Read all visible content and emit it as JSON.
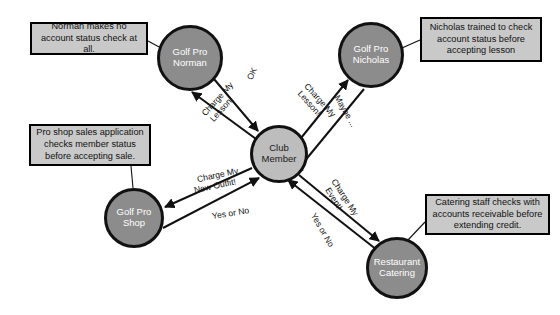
{
  "diagram": {
    "background_color": "#ffffff",
    "node_fill_dark": "#8c8c8c",
    "node_fill_light": "#bdbdbd",
    "node_stroke": "#111111",
    "note_fill": "#c9c9c9",
    "note_stroke": "#000000",
    "edge_color": "#111111"
  },
  "nodes": [
    {
      "id": "norman",
      "line1": "Golf Pro",
      "line2": "Norman",
      "style": "dark",
      "cx": 190,
      "cy": 58,
      "r": 33
    },
    {
      "id": "nicholas",
      "line1": "Golf Pro",
      "line2": "Nicholas",
      "style": "dark",
      "cx": 371,
      "cy": 55,
      "r": 33
    },
    {
      "id": "club",
      "line1": "Club",
      "line2": "Member",
      "style": "light",
      "cx": 279,
      "cy": 154,
      "r": 29
    },
    {
      "id": "shop",
      "line1": "Golf Pro",
      "line2": "Shop",
      "style": "dark",
      "cx": 134,
      "cy": 218,
      "r": 30
    },
    {
      "id": "restaurant",
      "line1": "Restaurant",
      "line2": "Catering",
      "style": "dark",
      "cx": 397,
      "cy": 268,
      "r": 31
    }
  ],
  "notes": [
    {
      "id": "note-norman",
      "text": "Norman makes no account status check at all.",
      "x": 30,
      "y": 22,
      "w": 118,
      "h": 33
    },
    {
      "id": "note-nicholas",
      "text": "Nicholas trained to check account status before accepting lesson",
      "x": 420,
      "y": 17,
      "w": 122,
      "h": 45
    },
    {
      "id": "note-shop",
      "text": "Pro shop sales application checks member status before accepting sale.",
      "x": 29,
      "y": 124,
      "w": 122,
      "h": 42
    },
    {
      "id": "note-restaurant",
      "text": "Catering staff checks with accounts receivable before extending credit.",
      "x": 425,
      "y": 194,
      "w": 125,
      "h": 41
    }
  ],
  "edge_labels": [
    {
      "id": "label-ok",
      "text": "OK",
      "x": 250,
      "y": 78,
      "rotate": -65
    },
    {
      "id": "label-charge-lesson-n",
      "text": "Charge My\nLesson!",
      "x": 218,
      "y": 106,
      "rotate": -48
    },
    {
      "id": "label-charge-lesson-nic",
      "text": "Charge My\nLesson!",
      "x": 313,
      "y": 100,
      "rotate": 48
    },
    {
      "id": "label-maybe",
      "text": "Maybe ...",
      "x": 343,
      "y": 107,
      "rotate": 60
    },
    {
      "id": "label-charge-outfit",
      "text": "Charge My\nNew Outfit!",
      "x": 214,
      "y": 181,
      "rotate": -12
    },
    {
      "id": "label-yes-or-no-shop",
      "text": "Yes or No",
      "x": 226,
      "y": 214,
      "rotate": -9
    },
    {
      "id": "label-charge-event",
      "text": "Charge My\nEvent!",
      "x": 338,
      "y": 196,
      "rotate": 57
    },
    {
      "id": "label-yes-or-no-rest",
      "text": "Yes or No",
      "x": 320,
      "y": 226,
      "rotate": 60
    }
  ],
  "edges": [
    {
      "id": "edge-norman-to-club",
      "from": "Golf Pro Norman",
      "to": "Club Member",
      "label": "OK"
    },
    {
      "id": "edge-club-to-norman",
      "from": "Club Member",
      "to": "Golf Pro Norman",
      "label": "Charge My Lesson!"
    },
    {
      "id": "edge-club-to-nicholas",
      "from": "Club Member",
      "to": "Golf Pro Nicholas",
      "label": "Charge My Lesson!"
    },
    {
      "id": "edge-nicholas-to-club",
      "from": "Golf Pro Nicholas",
      "to": "Club Member",
      "label": "Maybe ..."
    },
    {
      "id": "edge-club-to-shop",
      "from": "Club Member",
      "to": "Golf Pro Shop",
      "label": "Charge My New Outfit!"
    },
    {
      "id": "edge-shop-to-club",
      "from": "Golf Pro Shop",
      "to": "Club Member",
      "label": "Yes or No"
    },
    {
      "id": "edge-club-to-restaurant",
      "from": "Club Member",
      "to": "Restaurant Catering",
      "label": "Charge My Event!"
    },
    {
      "id": "edge-restaurant-to-club",
      "from": "Restaurant Catering",
      "to": "Club Member",
      "label": "Yes or No"
    }
  ]
}
